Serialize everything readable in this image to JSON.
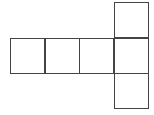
{
  "diagram": {
    "title": "",
    "line_color": "#444444",
    "background": "#ffffff",
    "grid_cells": [
      {
        "id": "row-square-1",
        "col": 0,
        "row": 1
      },
      {
        "id": "row-square-2",
        "col": 1,
        "row": 1
      },
      {
        "id": "row-square-3",
        "col": 2,
        "row": 1
      },
      {
        "id": "row-square-4",
        "col": 3,
        "row": 1
      },
      {
        "id": "top-square",
        "col": 3,
        "row": 0
      },
      {
        "id": "bottom-square",
        "col": 3,
        "row": 2
      }
    ]
  }
}
